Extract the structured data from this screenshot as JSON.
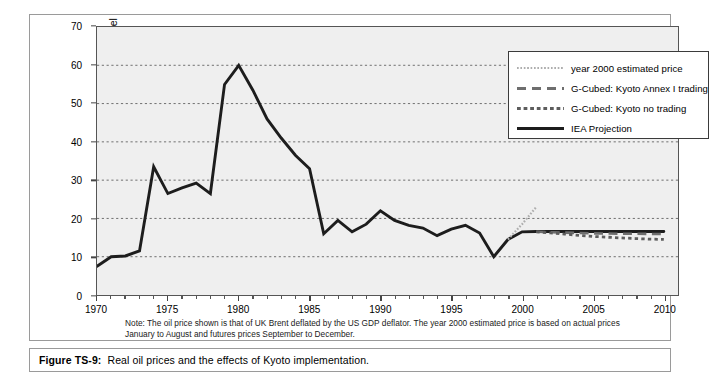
{
  "figure": {
    "caption_prefix": "Figure TS-9:",
    "caption_text": "Real oil prices and the effects of Kyoto implementation.",
    "note": "Note: The oil price shown is that of UK Brent deflated by the US GDP deflator. The year 2000 estimated price is based on actual prices January to August and futures prices September to December."
  },
  "legend": {
    "items": [
      {
        "label": "year 2000 estimated price",
        "style": "fine-dotted",
        "color": "#aeaeae"
      },
      {
        "label": "G-Cubed: Kyoto Annex I trading",
        "style": "dashed",
        "color": "#6e6e6e"
      },
      {
        "label": "G-Cubed: Kyoto no trading",
        "style": "dotted",
        "color": "#5d5d5d"
      },
      {
        "label": "IEA Projection",
        "style": "solid",
        "color": "#1d1d1d"
      }
    ]
  },
  "chart_data": {
    "type": "line",
    "title": "",
    "xlabel": "",
    "ylabel": "Real oil price $(1990) per barrel",
    "xlim": [
      1970,
      2011
    ],
    "ylim": [
      0,
      70
    ],
    "yticks": [
      0,
      10,
      20,
      30,
      40,
      50,
      60,
      70
    ],
    "xticks": [
      1970,
      1975,
      1980,
      1985,
      1990,
      1995,
      2000,
      2005,
      2010
    ],
    "grid": "horizontal-dotted",
    "legend_position": "top-right",
    "series": [
      {
        "name": "IEA Projection",
        "style": "solid",
        "color": "#1d1d1d",
        "x": [
          1970,
          1971,
          1972,
          1973,
          1974,
          1975,
          1976,
          1977,
          1978,
          1979,
          1980,
          1981,
          1982,
          1983,
          1984,
          1985,
          1986,
          1987,
          1988,
          1989,
          1990,
          1991,
          1992,
          1993,
          1994,
          1995,
          1996,
          1997,
          1998,
          1999,
          2000,
          2001,
          2002,
          2003,
          2004,
          2005,
          2006,
          2007,
          2008,
          2009,
          2010
        ],
        "values": [
          7.5,
          10.0,
          10.2,
          11.5,
          33.5,
          26.5,
          28.0,
          29.2,
          26.5,
          55.0,
          60.0,
          53.5,
          46.0,
          41.0,
          36.5,
          33.0,
          16.0,
          19.5,
          16.5,
          18.5,
          22.0,
          19.5,
          18.2,
          17.5,
          15.5,
          17.2,
          18.2,
          16.2,
          10.0,
          14.5,
          16.5,
          16.6,
          16.6,
          16.6,
          16.6,
          16.6,
          16.6,
          16.6,
          16.6,
          16.6,
          16.6
        ]
      },
      {
        "name": "year 2000 estimated price",
        "style": "fine-dotted",
        "color": "#aeaeae",
        "x": [
          1999,
          2000,
          2001
        ],
        "values": [
          14.5,
          18.5,
          23.0
        ]
      },
      {
        "name": "G-Cubed: Kyoto Annex I trading",
        "style": "dashed",
        "color": "#6e6e6e",
        "x": [
          2001,
          2002,
          2003,
          2004,
          2005,
          2006,
          2007,
          2008,
          2009,
          2010
        ],
        "values": [
          16.5,
          16.4,
          16.3,
          16.2,
          16.1,
          16.05,
          16.0,
          16.0,
          15.95,
          15.9
        ]
      },
      {
        "name": "G-Cubed: Kyoto no trading",
        "style": "dotted",
        "color": "#5d5d5d",
        "x": [
          2001,
          2002,
          2003,
          2004,
          2005,
          2006,
          2007,
          2008,
          2009,
          2010
        ],
        "values": [
          16.5,
          16.2,
          15.9,
          15.6,
          15.3,
          15.1,
          14.9,
          14.75,
          14.6,
          14.5
        ]
      }
    ]
  }
}
